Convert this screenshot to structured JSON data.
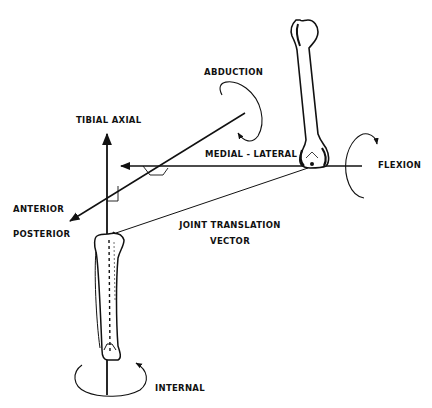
{
  "diagram": {
    "labels": {
      "tibial_axial": "TIBIAL AXIAL",
      "abduction": "ABDUCTION",
      "medial_lateral": "MEDIAL - LATERAL",
      "flexion": "FLEXION",
      "anterior": "ANTERIOR",
      "posterior": "POSTERIOR",
      "joint_translation_line1": "JOINT TRANSLATION",
      "joint_translation_line2": "VECTOR",
      "internal": "INTERNAL"
    },
    "colors": {
      "ink": "#111111",
      "background": "#ffffff"
    },
    "elements": [
      "femur-bone",
      "tibia-bone",
      "tibial-axial-axis",
      "medial-lateral-axis",
      "anterior-posterior-axis",
      "joint-translation-vector",
      "abduction-rotation-arrow",
      "flexion-rotation-arrow",
      "internal-rotation-arrow"
    ]
  }
}
